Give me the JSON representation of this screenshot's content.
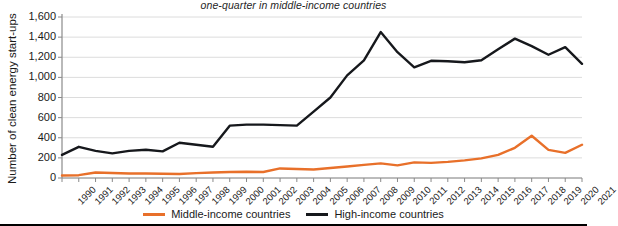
{
  "chart_data": {
    "type": "line",
    "title": "one-quarter in middle-income countries",
    "xlabel": "",
    "ylabel": "Number of clean energy start-ups",
    "ylim": [
      0,
      1600
    ],
    "ytick_step": 200,
    "grid": true,
    "legend_position": "bottom",
    "categories": [
      "1990",
      "1991",
      "1992",
      "1993",
      "1994",
      "1995",
      "1996",
      "1997",
      "1998",
      "1999",
      "2000",
      "2001",
      "2002",
      "2003",
      "2004",
      "2005",
      "2006",
      "2007",
      "2008",
      "2009",
      "2010",
      "2011",
      "2012",
      "2013",
      "2014",
      "2015",
      "2016",
      "2017",
      "2018",
      "2019",
      "2020",
      "2021"
    ],
    "ytick_labels": [
      "0",
      "200",
      "400",
      "600",
      "800",
      "1,000",
      "1,200",
      "1,400",
      "1,600"
    ],
    "ytick_values": [
      0,
      200,
      400,
      600,
      800,
      1000,
      1200,
      1400,
      1600
    ],
    "series": [
      {
        "name": "Middle-income countries",
        "color": "#E8702A",
        "values": [
          25,
          28,
          55,
          50,
          45,
          45,
          42,
          40,
          48,
          55,
          60,
          62,
          60,
          95,
          90,
          85,
          100,
          115,
          130,
          145,
          125,
          155,
          150,
          160,
          175,
          195,
          230,
          300,
          420,
          280,
          250,
          330
        ]
      },
      {
        "name": "High-income countries",
        "color": "#16181C",
        "values": [
          230,
          310,
          270,
          245,
          270,
          280,
          265,
          350,
          330,
          310,
          520,
          530,
          530,
          525,
          520,
          660,
          800,
          1020,
          1170,
          1450,
          1250,
          1100,
          1165,
          1160,
          1150,
          1170,
          1280,
          1385,
          1310,
          1225,
          1300,
          1135
        ]
      }
    ]
  },
  "legend": {
    "items": [
      {
        "label": "Middle-income countries",
        "color": "#E8702A"
      },
      {
        "label": "High-income countries",
        "color": "#16181C"
      }
    ]
  }
}
